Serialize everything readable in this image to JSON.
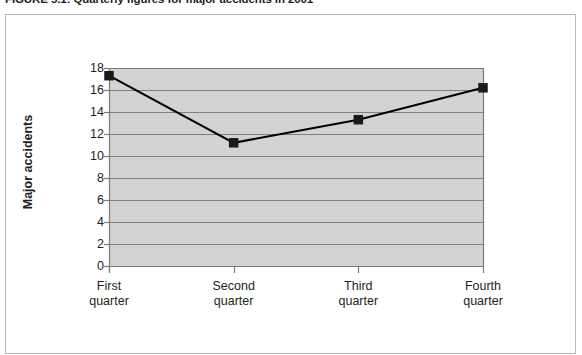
{
  "figure": {
    "caption": "FIGURE 5.1: Quarterly figures for major accidents in 2001"
  },
  "colors": {
    "plot_background": "#d3d3d3",
    "gridline": "#808080",
    "axis": "#7a7a7a",
    "series_line": "#000000",
    "marker": "#1a1a1a",
    "frame_border": "#b9b9b9",
    "text": "#231f20"
  },
  "chart_data": {
    "type": "line",
    "title": "FIGURE 5.1: Quarterly figures for major accidents in 2001",
    "xlabel": "",
    "ylabel": "Major accidents",
    "categories": [
      "First quarter",
      "Second quarter",
      "Third quarter",
      "Fourth quarter"
    ],
    "category_lines": [
      [
        "First",
        "quarter"
      ],
      [
        "Second",
        "quarter"
      ],
      [
        "Third",
        "quarter"
      ],
      [
        "Fourth",
        "quarter"
      ]
    ],
    "values": [
      17.3,
      11.2,
      13.3,
      16.2
    ],
    "ylim": [
      0,
      18
    ],
    "ytick_values": [
      0,
      2,
      4,
      6,
      8,
      10,
      12,
      14,
      16,
      18
    ],
    "ytick_labels": [
      "0",
      "2",
      "4",
      "6",
      "8",
      "10",
      "12",
      "14",
      "16",
      "18"
    ],
    "grid": true,
    "grid_axis": "y",
    "legend": false,
    "marker": "square",
    "series": [
      {
        "name": "Major accidents",
        "values": [
          17.3,
          11.2,
          13.3,
          16.2
        ]
      }
    ]
  }
}
